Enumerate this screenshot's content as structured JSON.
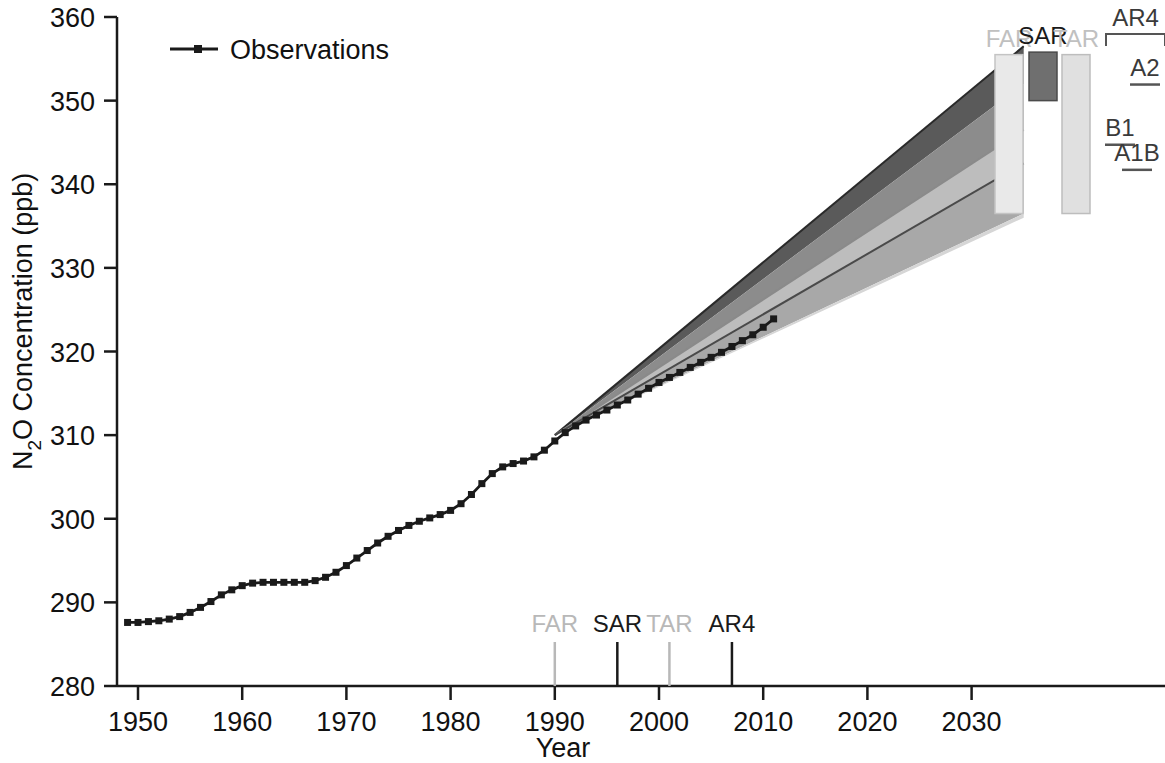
{
  "chart_data": {
    "type": "line",
    "title": "",
    "xlabel": "Year",
    "ylabel_parts": {
      "pre": "N",
      "sub": "2",
      "post": "O Concentration (ppb)"
    },
    "ylabel": "N2O Concentration (ppb)",
    "xlim": [
      1947,
      2036
    ],
    "ylim": [
      280,
      360
    ],
    "xticks": [
      1950,
      1960,
      1970,
      1980,
      1990,
      2000,
      2010,
      2020,
      2030
    ],
    "xtick_labels": [
      "1950",
      "1960",
      "1970",
      "1980",
      "1990",
      "2000",
      "2010",
      "2020",
      "2030"
    ],
    "yticks": [
      280,
      290,
      300,
      310,
      320,
      330,
      340,
      350,
      360
    ],
    "ytick_labels": [
      "280",
      "290",
      "300",
      "310",
      "320",
      "330",
      "340",
      "350",
      "360"
    ],
    "grid": false,
    "legend": [
      {
        "name": "Observations",
        "marker": "square",
        "line": "solid",
        "color": "#1a1a1a"
      }
    ],
    "series": [
      {
        "name": "Observations",
        "color": "#1a1a1a",
        "x": [
          1949,
          1950,
          1951,
          1952,
          1953,
          1954,
          1955,
          1956,
          1957,
          1958,
          1959,
          1960,
          1961,
          1962,
          1963,
          1964,
          1965,
          1966,
          1967,
          1968,
          1969,
          1970,
          1971,
          1972,
          1973,
          1974,
          1975,
          1976,
          1977,
          1978,
          1979,
          1980,
          1981,
          1982,
          1983,
          1984,
          1985,
          1986,
          1987,
          1988,
          1989,
          1990,
          1991,
          1992,
          1993,
          1994,
          1995,
          1996,
          1997,
          1998,
          1999,
          2000,
          2001,
          2002,
          2003,
          2004,
          2005,
          2006,
          2007,
          2008,
          2009,
          2010,
          2011
        ],
        "y": [
          287.6,
          287.6,
          287.7,
          287.8,
          288.0,
          288.3,
          288.8,
          289.4,
          290.1,
          290.9,
          291.5,
          292.0,
          292.3,
          292.4,
          292.4,
          292.4,
          292.4,
          292.4,
          292.6,
          293.0,
          293.6,
          294.4,
          295.3,
          296.2,
          297.1,
          297.9,
          298.6,
          299.2,
          299.7,
          300.1,
          300.5,
          301.0,
          301.8,
          302.9,
          304.2,
          305.4,
          306.2,
          306.6,
          306.9,
          307.4,
          308.2,
          309.3,
          310.3,
          311.1,
          311.8,
          312.4,
          313.0,
          313.6,
          314.2,
          314.9,
          315.6,
          316.3,
          316.9,
          317.5,
          318.1,
          318.7,
          319.3,
          319.9,
          320.6,
          321.3,
          322.0,
          322.9,
          323.9
        ]
      }
    ],
    "projection_fan": {
      "start_year": 1990,
      "start_value": 310.0,
      "end_year": 2035,
      "bands": [
        {
          "name": "outer-upper-dark",
          "color": "#5a5a5a",
          "end_top": 356.5,
          "end_bottom": 352.0
        },
        {
          "name": "upper-medium",
          "color": "#8c8c8c",
          "end_top": 352.0,
          "end_bottom": 346.5
        },
        {
          "name": "mid-light",
          "color": "#bdbdbd",
          "end_top": 346.5,
          "end_bottom": 342.5
        },
        {
          "name": "lower-medium",
          "color": "#a8a8a8",
          "end_top": 342.5,
          "end_bottom": 336.5
        },
        {
          "name": "outer-lower-light",
          "color": "#d6d6d6",
          "end_top": 336.5,
          "end_bottom": 336.0
        }
      ],
      "center_lines": [
        {
          "name": "line-top",
          "end_value": 356.5,
          "color": "#2a2a2a"
        },
        {
          "name": "line-mid",
          "end_value": 346.5,
          "color": "#8a8a8a"
        },
        {
          "name": "line-lower",
          "end_value": 342.5,
          "color": "#4a4a4a"
        }
      ]
    },
    "report_markers": [
      {
        "label": "FAR",
        "year": 1990,
        "color": "#b8b8b8"
      },
      {
        "label": "SAR",
        "year": 1996,
        "color": "#1a1a1a"
      },
      {
        "label": "TAR",
        "year": 2001,
        "color": "#b8b8b8"
      },
      {
        "label": "AR4",
        "year": 2007,
        "color": "#1a1a1a"
      }
    ],
    "range_bars": [
      {
        "label": "FAR",
        "top": 355.5,
        "bottom": 336.5,
        "fill": "#e9e9e9",
        "stroke": "#c4c4c4",
        "label_color": "#c0c0c0"
      },
      {
        "label": "SAR",
        "top": 355.8,
        "bottom": 350.0,
        "fill": "#6f6f6f",
        "stroke": "#4a4a4a",
        "label_color": "#1a1a1a"
      },
      {
        "label": "TAR",
        "top": 355.5,
        "bottom": 336.5,
        "fill": "#e0e0e0",
        "stroke": "#bdbdbd",
        "label_color": "#c0c0c0"
      }
    ],
    "ar4_bracket": {
      "label": "AR4",
      "scenarios": [
        {
          "label": "A2",
          "value": 353.0
        },
        {
          "label": "B1",
          "value": 345.8
        },
        {
          "label": "A1B",
          "value": 342.8
        }
      ]
    }
  }
}
